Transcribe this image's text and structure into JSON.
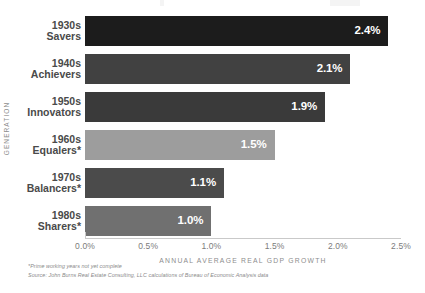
{
  "chart_data": {
    "type": "bar",
    "orientation": "horizontal",
    "title": "",
    "xlabel": "ANNUAL AVERAGE REAL GDP GROWTH",
    "ylabel": "GENERATION",
    "xlim": [
      0,
      2.5
    ],
    "xticks": [
      "0.0%",
      "0.5%",
      "1.0%",
      "1.5%",
      "2.0%",
      "2.5%"
    ],
    "xtick_values": [
      0.0,
      0.5,
      1.0,
      1.5,
      2.0,
      2.5
    ],
    "grid": false,
    "legend": "none",
    "categories": [
      "1930s Savers",
      "1940s Achievers",
      "1950s Innovators",
      "1960s Equalers*",
      "1970s Balancers*",
      "1980s Sharers*"
    ],
    "values": [
      2.4,
      2.1,
      1.9,
      1.5,
      1.1,
      1.0
    ],
    "value_labels": [
      "2.4%",
      "2.1%",
      "1.9%",
      "1.5%",
      "1.1%",
      "1.0%"
    ],
    "bars": [
      {
        "decade": "1930s",
        "name": "Savers",
        "value": 2.4,
        "label": "2.4%",
        "color": "#1c1c1c"
      },
      {
        "decade": "1940s",
        "name": "Achievers",
        "value": 2.1,
        "label": "2.1%",
        "color": "#414141"
      },
      {
        "decade": "1950s",
        "name": "Innovators",
        "value": 1.9,
        "label": "1.9%",
        "color": "#3a3a3a"
      },
      {
        "decade": "1960s",
        "name": "Equalers*",
        "value": 1.5,
        "label": "1.5%",
        "color": "#9d9d9d"
      },
      {
        "decade": "1970s",
        "name": "Balancers*",
        "value": 1.1,
        "label": "1.1%",
        "color": "#4b4b4b"
      },
      {
        "decade": "1980s",
        "name": "Sharers*",
        "value": 1.0,
        "label": "1.0%",
        "color": "#707070"
      }
    ]
  },
  "footnotes": {
    "asterisk_note": "*Prime working years not yet complete",
    "source": "Source: John Burns Real Estate Consulting, LLC calculations of Bureau of Economic Analysis data"
  },
  "colors": {
    "background": "#ffffff",
    "axis_text": "#7c7c7c",
    "axis_title": "#8d8d8d",
    "category_text": "#4a4a4a",
    "value_text": "#ffffff",
    "axis_line": "#c9c9c9"
  }
}
